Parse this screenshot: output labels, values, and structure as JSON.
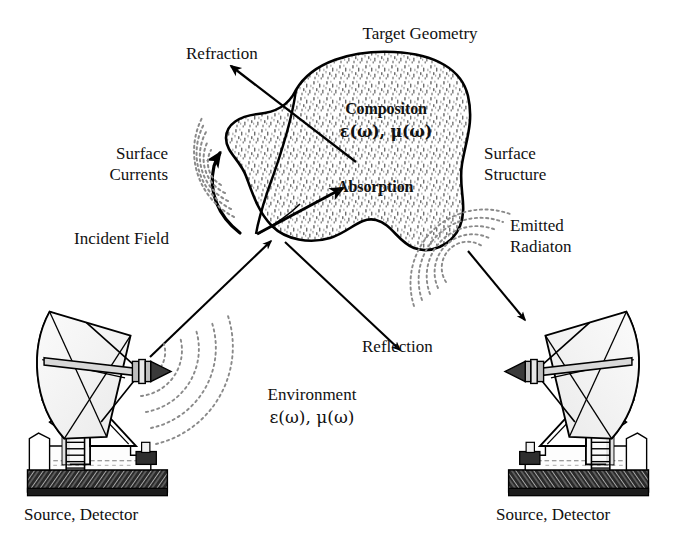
{
  "figure": {
    "kind": "schematic-diagram",
    "background_color": "#ffffff",
    "ink_color": "#000000",
    "stipple_color": "#6e6e6e"
  },
  "labels": {
    "target_geometry": "Target Geometry",
    "refraction": "Refraction",
    "surface_currents_line1": "Surface",
    "surface_currents_line2": "Currents",
    "surface_structure_line1": "Surface",
    "surface_structure_line2": "Structure",
    "composition_line1": "Compositon",
    "composition_line2": "ε(ω), μ(ω)",
    "absorption": "Absorption",
    "incident_field": "Incident Field",
    "emitted_radiation_line1": "Emitted",
    "emitted_radiation_line2": "Radiaton",
    "reflection": "Reflection",
    "environment_line1": "Environment",
    "environment_line2": "ε(ω), μ(ω)",
    "source_detector_left": "Source, Detector",
    "source_detector_right": "Source, Detector"
  },
  "icons": {
    "target_blob": "amoeba-target-shape",
    "antenna_left": "parabolic-dish-antenna",
    "antenna_right": "parabolic-dish-antenna-mirrored",
    "incident_waves": "concentric-dotted-wavefronts",
    "emitted_waves": "concentric-dotted-wavefronts",
    "surface_current_waves": "concentric-dotted-wavefronts",
    "arrow_refraction": "arrow-up-left",
    "arrow_absorption": "arrow-up-right",
    "arrow_incident": "arrow-up-right",
    "arrow_reflection": "arrow-down-right",
    "arrow_emitted": "arrow-down-right",
    "arrow_surface_current": "curved-arrow-up"
  },
  "arrows": [
    {
      "name": "refraction",
      "from": [
        355,
        160
      ],
      "to": [
        228,
        62
      ]
    },
    {
      "name": "absorption",
      "from": [
        283,
        228
      ],
      "to": [
        345,
        186
      ]
    },
    {
      "name": "incident-field",
      "from": [
        148,
        355
      ],
      "to": [
        273,
        239
      ]
    },
    {
      "name": "reflection",
      "from": [
        283,
        240
      ],
      "to": [
        403,
        352
      ]
    },
    {
      "name": "emitted-radiation",
      "from": [
        470,
        253
      ],
      "to": [
        523,
        318
      ]
    },
    {
      "name": "surface-current",
      "from": [
        236,
        226
      ],
      "to": [
        218,
        152
      ]
    }
  ]
}
